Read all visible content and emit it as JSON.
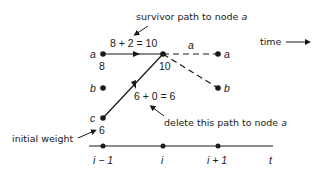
{
  "diagram": {
    "annotations": {
      "survivor": "survivor path to node ",
      "survivor_node": "a",
      "time": "time",
      "initial_weight": "initial weight",
      "delete": "delete this path to node ",
      "delete_node": "a"
    },
    "equations": {
      "top": "8 + 2 = 10",
      "bottom": "6 + 0 = 6"
    },
    "node_labels": {
      "a_prev": "a",
      "b_prev": "b",
      "c_prev": "c",
      "a_next": "a",
      "b_next": "b",
      "branch_a": "a"
    },
    "weights": {
      "a_prev": "8",
      "c_prev": "6",
      "node_i": "10"
    },
    "axis": {
      "ticks": [
        "i − 1",
        "i",
        "i + 1"
      ],
      "end_label": "t"
    },
    "colors": {
      "ink": "#1a1a1a",
      "background": "#ffffff"
    }
  }
}
